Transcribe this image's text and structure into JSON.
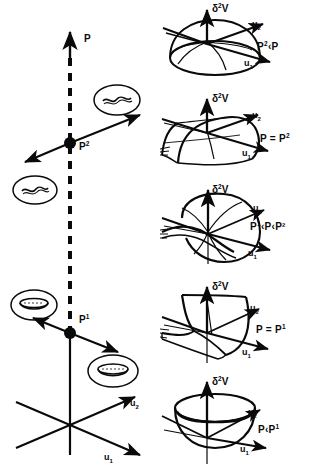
{
  "figure": {
    "left_panel": {
      "vertical_axis_label": "P",
      "horizontal_axis_labels": {
        "u1": "u",
        "u1_sub": "1",
        "u2": "u",
        "u2_sub": "2"
      },
      "bifurcation_points": [
        {
          "name": "P-squared-point",
          "label": "P",
          "superscript": "2"
        },
        {
          "name": "P-one-point",
          "label": "P",
          "superscript": "1"
        }
      ],
      "insets": [
        {
          "name": "saddle-inset-upper-right",
          "shape": "saddle"
        },
        {
          "name": "saddle-inset-left",
          "shape": "saddle"
        },
        {
          "name": "bowl-inset-upper-left",
          "shape": "bowl"
        },
        {
          "name": "bowl-inset-lower-right",
          "shape": "bowl"
        }
      ]
    },
    "right_panel": {
      "vertical_axis_label": "δ",
      "vertical_axis_sup": "2",
      "vertical_axis_tail": "V",
      "axis_u1": "u",
      "axis_u1_sub": "1",
      "axis_u2": "u",
      "axis_u2_sub": "2",
      "rows": [
        {
          "name": "dome-surface",
          "surface": "dome",
          "condition_pre": "P",
          "condition_sup": "2",
          "condition_post": "‹P"
        },
        {
          "name": "ridge-cylinder-surface",
          "surface": "ridge",
          "condition_pre": "P = P",
          "condition_sup": "2",
          "condition_post": ""
        },
        {
          "name": "saddle-surface",
          "surface": "saddle",
          "condition_pre": "P",
          "condition_sup": "1",
          "condition_post": "‹P‹P²"
        },
        {
          "name": "trough-cylinder-surface",
          "surface": "trough",
          "condition_pre": "P = P",
          "condition_sup": "1",
          "condition_post": ""
        },
        {
          "name": "bowl-surface",
          "surface": "bowl",
          "condition_pre": "P‹P",
          "condition_sup": "1",
          "condition_post": ""
        }
      ]
    }
  }
}
